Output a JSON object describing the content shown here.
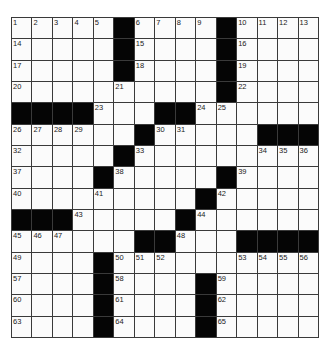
{
  "puzzle": {
    "rows": 15,
    "cols": 15,
    "colors": {
      "block": "#050505",
      "cell": "#fbfbfb",
      "line": "#3a3a3a"
    },
    "grid": [
      [
        "1",
        "2",
        "3",
        "4",
        "5",
        "#",
        "6",
        "7",
        "8",
        "9",
        "#",
        "10",
        "11",
        "12",
        "13"
      ],
      [
        "14",
        ".",
        ".",
        ".",
        ".",
        "#",
        "15",
        ".",
        ".",
        ".",
        "#",
        "16",
        ".",
        ".",
        "."
      ],
      [
        "17",
        ".",
        ".",
        ".",
        ".",
        "#",
        "18",
        ".",
        ".",
        ".",
        "#",
        "19",
        ".",
        ".",
        "."
      ],
      [
        "20",
        ".",
        ".",
        ".",
        ".",
        "21",
        ".",
        ".",
        ".",
        ".",
        "#",
        "22",
        ".",
        ".",
        "."
      ],
      [
        "#",
        "#",
        "#",
        "#",
        "23",
        ".",
        ".",
        "#",
        "#",
        "24",
        "25",
        ".",
        ".",
        ".",
        "."
      ],
      [
        "26",
        "27",
        "28",
        "29",
        ".",
        ".",
        "#",
        "30",
        "31",
        ".",
        ".",
        ".",
        "#",
        "#",
        "#"
      ],
      [
        "32",
        ".",
        ".",
        ".",
        ".",
        "#",
        "33",
        ".",
        ".",
        ".",
        ".",
        ".",
        "34",
        "35",
        "36"
      ],
      [
        "37",
        ".",
        ".",
        ".",
        "#",
        "38",
        ".",
        ".",
        ".",
        ".",
        "#",
        "39",
        ".",
        ".",
        "."
      ],
      [
        "40",
        ".",
        ".",
        ".",
        "41",
        ".",
        ".",
        ".",
        ".",
        "#",
        "42",
        ".",
        ".",
        ".",
        "."
      ],
      [
        "#",
        "#",
        "#",
        "43",
        ".",
        ".",
        ".",
        ".",
        "#",
        "44",
        ".",
        ".",
        ".",
        ".",
        "."
      ],
      [
        "45",
        "46",
        "47",
        ".",
        ".",
        ".",
        "#",
        "#",
        "48",
        ".",
        ".",
        "#",
        "#",
        "#",
        "#"
      ],
      [
        "49",
        ".",
        ".",
        ".",
        "#",
        "50",
        "51",
        "52",
        ".",
        ".",
        ".",
        "53",
        "54",
        "55",
        "56"
      ],
      [
        "57",
        ".",
        ".",
        ".",
        "#",
        "58",
        ".",
        ".",
        ".",
        "#",
        "59",
        ".",
        ".",
        ".",
        "."
      ],
      [
        "60",
        ".",
        ".",
        ".",
        "#",
        "61",
        ".",
        ".",
        ".",
        "#",
        "62",
        ".",
        ".",
        ".",
        "."
      ],
      [
        "63",
        ".",
        ".",
        ".",
        "#",
        "64",
        ".",
        ".",
        ".",
        "#",
        "65",
        ".",
        ".",
        ".",
        "."
      ]
    ]
  }
}
